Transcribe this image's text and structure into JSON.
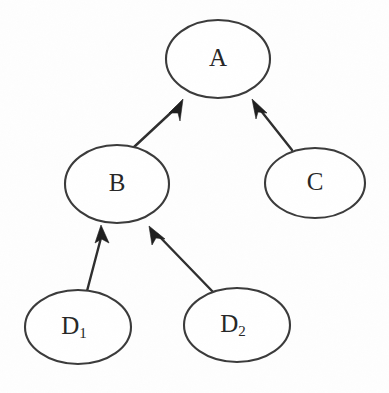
{
  "diagram": {
    "type": "directed-graph",
    "canvas": {
      "width": 389,
      "height": 393
    },
    "background_color": "#fefefe",
    "stroke_color": "#3a3a3a",
    "arrow_color": "#1e1e1e",
    "label_color": "#262626",
    "nodes": [
      {
        "id": "A",
        "label": "A",
        "subscript": "",
        "shape": "ellipse",
        "cx": 218,
        "cy": 59,
        "rx": 52,
        "ry": 39
      },
      {
        "id": "B",
        "label": "B",
        "subscript": "",
        "shape": "ellipse",
        "cx": 117,
        "cy": 184,
        "rx": 52,
        "ry": 39
      },
      {
        "id": "C",
        "label": "C",
        "subscript": "",
        "shape": "ellipse",
        "cx": 315,
        "cy": 183,
        "rx": 50,
        "ry": 35
      },
      {
        "id": "D1",
        "label": "D",
        "subscript": "1",
        "shape": "ellipse",
        "cx": 78,
        "cy": 327,
        "rx": 53,
        "ry": 37
      },
      {
        "id": "D2",
        "label": "D",
        "subscript": "2",
        "shape": "ellipse",
        "cx": 237,
        "cy": 325,
        "rx": 53,
        "ry": 37
      }
    ],
    "edges": [
      {
        "id": "edge-b-a",
        "from": "B",
        "to": "A",
        "x1": 134,
        "y1": 147,
        "x2": 182,
        "y2": 101,
        "arrow_at": "to"
      },
      {
        "id": "edge-c-a",
        "from": "C",
        "to": "A",
        "x1": 292,
        "y1": 150,
        "x2": 254,
        "y2": 101,
        "arrow_at": "to"
      },
      {
        "id": "edge-d1-b",
        "from": "D1",
        "to": "B",
        "x1": 87,
        "y1": 291,
        "x2": 101,
        "y2": 227,
        "arrow_at": "to"
      },
      {
        "id": "edge-d2-b",
        "from": "D2",
        "to": "B",
        "x1": 214,
        "y1": 293,
        "x2": 152,
        "y2": 229,
        "arrow_at": "to"
      }
    ]
  }
}
